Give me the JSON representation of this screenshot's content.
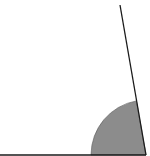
{
  "diagram": {
    "type": "angle",
    "vertex": [
      146,
      155
    ],
    "ray_horizontal_end": [
      0,
      155
    ],
    "ray_slanted_end": [
      120,
      5
    ],
    "arc": {
      "radius": 55,
      "start_point": [
        91,
        155
      ],
      "end_point": [
        136,
        101
      ],
      "fill": "#8c8c8c"
    },
    "colors": {
      "stroke": "#1a1a1a",
      "arc_fill": "#8c8c8c",
      "background": "#ffffff"
    }
  }
}
